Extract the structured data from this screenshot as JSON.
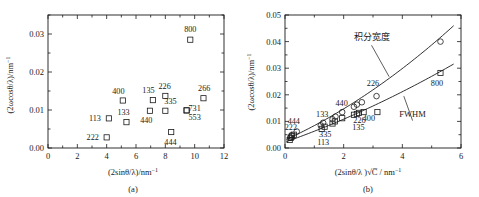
{
  "figure": {
    "panels": [
      {
        "key": "a",
        "caption": "(a)"
      },
      {
        "key": "b",
        "caption": "(b)"
      }
    ]
  },
  "chart_data": [
    {
      "type": "scatter",
      "panel": "(a)",
      "title": "",
      "xlabel": "(2sinθ/λ)/nm⁻¹",
      "ylabel": "(2ωcosθ/λ)/nm⁻¹",
      "xlim": [
        0,
        12
      ],
      "ylim": [
        0,
        0.035
      ],
      "xticks": [
        0,
        2,
        4,
        6,
        8,
        10,
        12
      ],
      "xticklabels": [
        "0",
        "2",
        "4",
        "6",
        "8",
        "10",
        "12"
      ],
      "yticks": [
        0.0,
        0.01,
        0.02,
        0.03
      ],
      "yticklabels": [
        "0.00",
        "0.01",
        "0.02",
        "0.03"
      ],
      "grid": false,
      "legend": "none",
      "series": [
        {
          "name": "FWHM",
          "marker": "square",
          "points": [
            {
              "label": "222",
              "x": 4.0,
              "y": 0.0028,
              "lx": -0.95,
              "ly": 0.0
            },
            {
              "label": "113",
              "x": 4.15,
              "y": 0.0078,
              "lx": -0.95,
              "ly": 0.0
            },
            {
              "label": "400",
              "x": 5.1,
              "y": 0.0125,
              "lx": -0.3,
              "ly": 0.0025
            },
            {
              "label": "133",
              "x": 5.35,
              "y": 0.0068,
              "lx": -0.2,
              "ly": 0.0026
            },
            {
              "label": "440",
              "x": 6.95,
              "y": 0.0098,
              "lx": -0.25,
              "ly": -0.0024
            },
            {
              "label": "135",
              "x": 7.15,
              "y": 0.0126,
              "lx": -0.3,
              "ly": 0.0026
            },
            {
              "label": "226",
              "x": 8.0,
              "y": 0.0137,
              "lx": -0.05,
              "ly": 0.0026
            },
            {
              "label": "335",
              "x": 8.0,
              "y": 0.0098,
              "lx": 0.35,
              "ly": 0.0026
            },
            {
              "label": "444",
              "x": 8.4,
              "y": 0.0042,
              "lx": -0.05,
              "ly": -0.0026
            },
            {
              "label": "731",
              "x": 9.45,
              "y": 0.0099,
              "lx": 0.55,
              "ly": 0.0006
            },
            {
              "label": "553",
              "x": 9.45,
              "y": 0.0099,
              "lx": 0.55,
              "ly": -0.0017
            },
            {
              "label": "266",
              "x": 10.6,
              "y": 0.0131,
              "lx": 0.05,
              "ly": 0.0026
            },
            {
              "label": "800",
              "x": 9.7,
              "y": 0.0285,
              "lx": 0.0,
              "ly": 0.0027
            }
          ]
        }
      ]
    },
    {
      "type": "scatter",
      "panel": "(b)",
      "title": "",
      "xlabel": "(2sinθ/λ )√C / nm⁻¹",
      "ylabel": "(2ωcosθ/λ)/nm⁻¹",
      "xlim": [
        0,
        6
      ],
      "ylim": [
        0,
        0.05
      ],
      "xticks": [
        0,
        2,
        4,
        6
      ],
      "xticklabels": [
        "0",
        "2",
        "4",
        "6"
      ],
      "yticks": [
        0.0,
        0.01,
        0.02,
        0.03,
        0.04,
        0.05
      ],
      "yticklabels": [
        "0.00",
        "0.01",
        "0.02",
        "0.03",
        "0.04",
        "0.05"
      ],
      "grid": false,
      "legend": "inline-annotations",
      "annotations": [
        {
          "text": "积分宽度",
          "x": 2.95,
          "y": 0.0405,
          "arrow_to_x": 3.55,
          "arrow_to_y": 0.0268
        },
        {
          "text": "FWHM",
          "x": 4.35,
          "y": 0.0118,
          "arrow_to_x": 4.05,
          "arrow_to_y": 0.0195
        }
      ],
      "series": [
        {
          "name": "积分宽度",
          "marker": "circle",
          "points": [
            {
              "label": "444",
              "x": 0.18,
              "y": 0.004,
              "lx": 0.12,
              "ly": 0.0062
            },
            {
              "label": "222",
              "x": 0.22,
              "y": 0.0048,
              "lx": -0.02,
              "ly": 0.003
            },
            {
              "label": "",
              "x": 0.4,
              "y": 0.0062,
              "lx": 0,
              "ly": 0
            },
            {
              "label": "133",
              "x": 1.22,
              "y": 0.0085,
              "lx": 0.05,
              "ly": 0.0042
            },
            {
              "label": "",
              "x": 1.3,
              "y": 0.0095,
              "lx": 0,
              "ly": 0
            },
            {
              "label": "",
              "x": 1.62,
              "y": 0.0108,
              "lx": 0,
              "ly": 0
            },
            {
              "label": "",
              "x": 1.72,
              "y": 0.0118,
              "lx": 0,
              "ly": 0
            },
            {
              "label": "440",
              "x": 1.95,
              "y": 0.0135,
              "lx": -0.02,
              "ly": 0.0036
            },
            {
              "label": "",
              "x": 2.35,
              "y": 0.0155,
              "lx": 0,
              "ly": 0
            },
            {
              "label": "",
              "x": 2.45,
              "y": 0.0163,
              "lx": 0,
              "ly": 0
            },
            {
              "label": "",
              "x": 2.62,
              "y": 0.0172,
              "lx": 0,
              "ly": 0
            },
            {
              "label": "226",
              "x": 3.12,
              "y": 0.0195,
              "lx": -0.12,
              "ly": 0.0048
            },
            {
              "label": "",
              "x": 5.3,
              "y": 0.04,
              "lx": 0,
              "ly": 0
            }
          ]
        },
        {
          "name": "FWHM",
          "marker": "square",
          "points": [
            {
              "label": "",
              "x": 0.16,
              "y": 0.003,
              "lx": 0,
              "ly": 0
            },
            {
              "label": "",
              "x": 0.2,
              "y": 0.0038,
              "lx": 0,
              "ly": 0
            },
            {
              "label": "",
              "x": 0.24,
              "y": 0.0044,
              "lx": 0,
              "ly": 0
            },
            {
              "label": "",
              "x": 0.3,
              "y": 0.005,
              "lx": 0,
              "ly": 0
            },
            {
              "label": "113",
              "x": 1.25,
              "y": 0.0072,
              "lx": 0.05,
              "ly": -0.0048
            },
            {
              "label": "335",
              "x": 1.35,
              "y": 0.008,
              "lx": 0.02,
              "ly": -0.0028
            },
            {
              "label": "",
              "x": 1.62,
              "y": 0.0092,
              "lx": 0,
              "ly": 0
            },
            {
              "label": "",
              "x": 1.7,
              "y": 0.01,
              "lx": 0,
              "ly": 0
            },
            {
              "label": "",
              "x": 1.95,
              "y": 0.0112,
              "lx": 0,
              "ly": 0
            },
            {
              "label": "",
              "x": 2.35,
              "y": 0.0125,
              "lx": 0,
              "ly": 0
            },
            {
              "label": "135",
              "x": 2.45,
              "y": 0.0128,
              "lx": 0.05,
              "ly": -0.0048
            },
            {
              "label": "226",
              "x": 2.52,
              "y": 0.0132,
              "lx": 0.02,
              "ly": -0.0028
            },
            {
              "label": "400",
              "x": 2.68,
              "y": 0.0135,
              "lx": 0.18,
              "ly": -0.0022
            },
            {
              "label": "",
              "x": 3.15,
              "y": 0.0135,
              "lx": 0,
              "ly": 0
            },
            {
              "label": "800",
              "x": 5.3,
              "y": 0.0282,
              "lx": -0.12,
              "ly": -0.0038
            }
          ]
        }
      ]
    }
  ]
}
